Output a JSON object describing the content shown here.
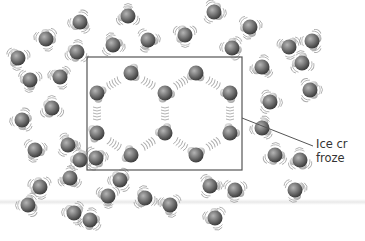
{
  "diagram": {
    "title": "",
    "label": {
      "line1": "Ice cr",
      "line2": "froze"
    },
    "colors": {
      "oxygen": "#6e6e6e",
      "hydrogen": "#d8d8d8",
      "frame": "#555555",
      "vibration": "#aaaaaa",
      "text": "#333333"
    },
    "frame": {
      "x": 87,
      "y": 57,
      "w": 155,
      "h": 113
    },
    "leader": {
      "x1": 242,
      "y1": 118,
      "x2": 313,
      "y2": 146
    },
    "lattice_molecules": [
      [
        131,
        73
      ],
      [
        97,
        93
      ],
      [
        165,
        93
      ],
      [
        196,
        73
      ],
      [
        230,
        93
      ],
      [
        97,
        133
      ],
      [
        131,
        155
      ],
      [
        165,
        133
      ],
      [
        196,
        155
      ],
      [
        230,
        133
      ]
    ],
    "free_molecules": [
      [
        18,
        58
      ],
      [
        46,
        39
      ],
      [
        80,
        22
      ],
      [
        128,
        16
      ],
      [
        214,
        12
      ],
      [
        250,
        27
      ],
      [
        289,
        47
      ],
      [
        312,
        41
      ],
      [
        77,
        52
      ],
      [
        113,
        45
      ],
      [
        148,
        40
      ],
      [
        185,
        35
      ],
      [
        232,
        48
      ],
      [
        262,
        67
      ],
      [
        302,
        63
      ],
      [
        310,
        90
      ],
      [
        30,
        80
      ],
      [
        60,
        77
      ],
      [
        22,
        120
      ],
      [
        52,
        108
      ],
      [
        68,
        145
      ],
      [
        35,
        150
      ],
      [
        40,
        187
      ],
      [
        28,
        205
      ],
      [
        70,
        178
      ],
      [
        80,
        160
      ],
      [
        96,
        158
      ],
      [
        108,
        196
      ],
      [
        74,
        213
      ],
      [
        90,
        220
      ],
      [
        145,
        198
      ],
      [
        210,
        186
      ],
      [
        235,
        190
      ],
      [
        215,
        218
      ],
      [
        262,
        128
      ],
      [
        300,
        160
      ],
      [
        270,
        102
      ],
      [
        295,
        190
      ],
      [
        170,
        205
      ],
      [
        120,
        180
      ],
      [
        275,
        155
      ]
    ]
  }
}
